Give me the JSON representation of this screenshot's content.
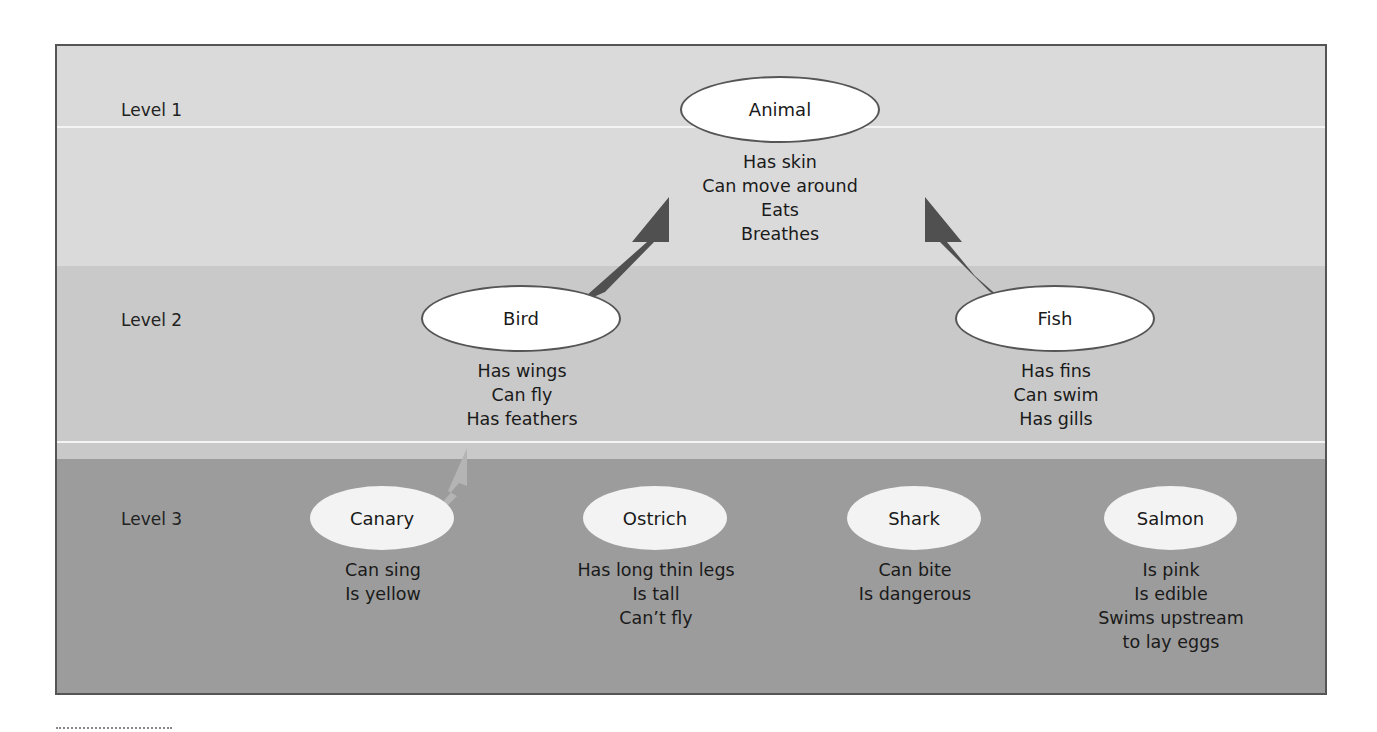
{
  "levels": [
    {
      "label": "Level 1"
    },
    {
      "label": "Level 2"
    },
    {
      "label": "Level 3"
    }
  ],
  "nodes": {
    "animal": {
      "label": "Animal",
      "properties": [
        "Has skin",
        "Can move around",
        "Eats",
        "Breathes"
      ]
    },
    "bird": {
      "label": "Bird",
      "properties": [
        "Has wings",
        "Can fly",
        "Has feathers"
      ]
    },
    "fish": {
      "label": "Fish",
      "properties": [
        "Has fins",
        "Can swim",
        "Has gills"
      ]
    },
    "canary": {
      "label": "Canary",
      "properties": [
        "Can sing",
        "Is yellow"
      ]
    },
    "ostrich": {
      "label": "Ostrich",
      "properties": [
        "Has long thin legs",
        "Is tall",
        "Can’t fly"
      ]
    },
    "shark": {
      "label": "Shark",
      "properties": [
        "Can bite",
        "Is dangerous"
      ]
    },
    "salmon": {
      "label": "Salmon",
      "properties": [
        "Is pink",
        "Is edible",
        "Swims upstream",
        "to lay eggs"
      ]
    }
  },
  "edges": [
    {
      "from": "Bird",
      "to": "Animal",
      "style": "dark"
    },
    {
      "from": "Fish",
      "to": "Animal",
      "style": "dark"
    },
    {
      "from": "Canary",
      "to": "Bird",
      "style": "light"
    },
    {
      "from": "Ostrich",
      "to": "Bird",
      "style": "light"
    },
    {
      "from": "Shark",
      "to": "Fish",
      "style": "light"
    },
    {
      "from": "Salmon",
      "to": "Fish",
      "style": "light"
    }
  ],
  "colors": {
    "level1_bg": "#dadada",
    "level2_bg": "#c9c9c9",
    "level3_bg": "#9c9c9c",
    "dark_arrow": "#505050",
    "light_arrow": "#b0b0b0",
    "frame_border": "#555555"
  }
}
